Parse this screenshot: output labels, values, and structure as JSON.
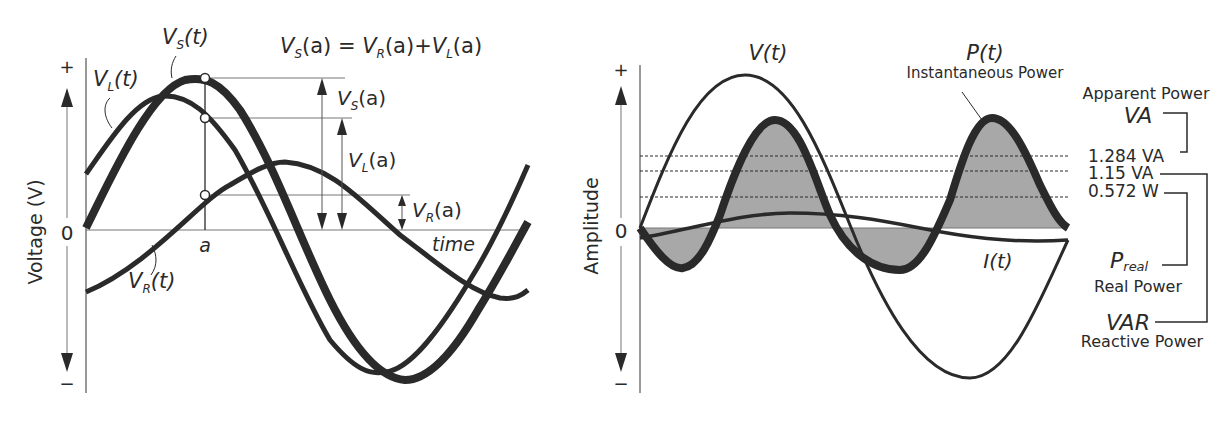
{
  "left_panel": {
    "y_axis_label": "Voltage (V)",
    "y_plus": "+",
    "y_zero": "0",
    "y_minus": "−",
    "x_axis_label": "time",
    "point_label": "a",
    "equation": {
      "lhs_main": "V",
      "lhs_sub": "S",
      "lhs_arg": "(a) = ",
      "t1_main": "V",
      "t1_sub": "R",
      "t1_arg": "(a)+",
      "t2_main": "V",
      "t2_sub": "L",
      "t2_arg": "(a)"
    },
    "curves": {
      "vs": {
        "main": "V",
        "sub": "S",
        "arg": "(t)"
      },
      "vl": {
        "main": "V",
        "sub": "L",
        "arg": "(t)"
      },
      "vr": {
        "main": "V",
        "sub": "R",
        "arg": "(t)"
      }
    },
    "measures": {
      "vs": {
        "main": "V",
        "sub": "S",
        "arg": "(a)"
      },
      "vl": {
        "main": "V",
        "sub": "L",
        "arg": "(a)"
      },
      "vr": {
        "main": "V",
        "sub": "R",
        "arg": "(a)"
      }
    }
  },
  "right_panel": {
    "y_axis_label": "Amplitude",
    "y_plus": "+",
    "y_zero": "0",
    "y_minus": "−",
    "curves": {
      "v": "V(t)",
      "i": "I(t)",
      "p": "P(t)",
      "p_desc": "Instantaneous Power"
    },
    "legend": {
      "apparent_title": "Apparent Power",
      "apparent_symbol": "VA",
      "value_apparent": "1.284 VA",
      "value_reactive": "1.15 VA",
      "value_real": "0.572 W",
      "real_symbol_main": "P",
      "real_symbol_sub": "real",
      "real_title": "Real Power",
      "reactive_symbol": "VAR",
      "reactive_title": "Reactive Power"
    }
  },
  "colors": {
    "ink": "#2a2a2a",
    "fill_power": "#a8a8a8",
    "guide": "#7a7a7a",
    "background": "#ffffff"
  }
}
